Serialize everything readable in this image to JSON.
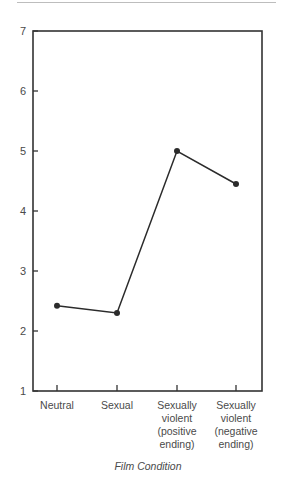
{
  "chart_data": {
    "type": "line",
    "title": "",
    "xlabel": "Film Condition",
    "ylabel": "",
    "categories": [
      "Neutral",
      "Sexual",
      "Sexually violent (positive ending)",
      "Sexually violent (negative ending)"
    ],
    "category_label_lines": [
      [
        "Neutral"
      ],
      [
        "Sexual"
      ],
      [
        "Sexually",
        "violent",
        "(positive",
        "ending)"
      ],
      [
        "Sexually",
        "violent",
        "(negative",
        "ending)"
      ]
    ],
    "values": [
      2.42,
      2.3,
      5.0,
      4.45
    ],
    "ylim": [
      1,
      7
    ],
    "yticks": [
      1,
      2,
      3,
      4,
      5,
      6,
      7
    ],
    "grid": false,
    "legend": null,
    "line_color": "#2b2b2b",
    "marker": "circle"
  }
}
